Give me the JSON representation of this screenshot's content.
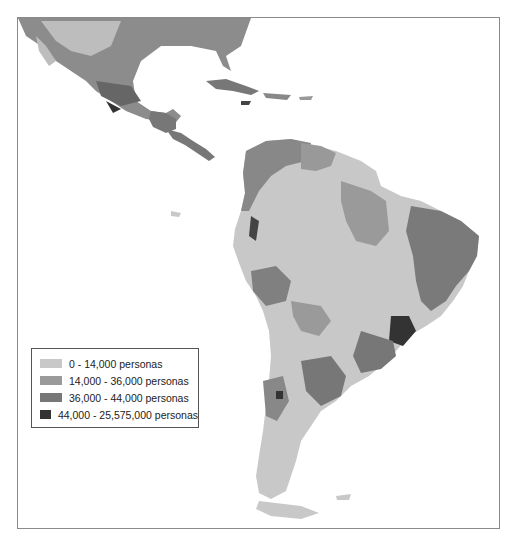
{
  "map": {
    "type": "choropleth",
    "region": "Latin America",
    "colors": {
      "class_1": "#c8c8c8",
      "class_2": "#9a9a9a",
      "class_3": "#777777",
      "class_4": "#333333",
      "water": "#ffffff",
      "frame": "#8a8a8a"
    }
  },
  "legend": {
    "items": [
      {
        "label": "0 - 14,000 personas",
        "color": "#c8c8c8"
      },
      {
        "label": "14,000 - 36,000 personas",
        "color": "#9a9a9a"
      },
      {
        "label": "36,000 - 44,000 personas",
        "color": "#777777"
      },
      {
        "label": "44,000 - 25,575,000 personas",
        "color": "#333333"
      }
    ]
  }
}
